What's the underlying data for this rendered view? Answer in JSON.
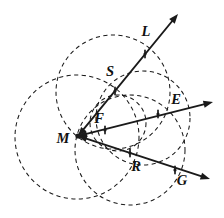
{
  "figure": {
    "kind": "geometry-diagram",
    "width": 224,
    "height": 218,
    "background_color": "#ffffff",
    "ink_color": "#1a1a1a",
    "label_color": "#111111",
    "vertex": {
      "name": "M",
      "label": "M",
      "x": 78,
      "y": 136,
      "label_x": 63,
      "label_y": 140
    },
    "labels": [
      {
        "name": "label-L",
        "text": "L",
        "x": 146,
        "y": 33
      },
      {
        "name": "label-S",
        "text": "S",
        "x": 110,
        "y": 73
      },
      {
        "name": "label-E",
        "text": "E",
        "x": 176,
        "y": 101
      },
      {
        "name": "label-F",
        "text": "F",
        "x": 99,
        "y": 120
      },
      {
        "name": "label-M",
        "text": "M",
        "x": 63,
        "y": 140
      },
      {
        "name": "label-R",
        "text": "R",
        "x": 136,
        "y": 168
      },
      {
        "name": "label-G",
        "text": "G",
        "x": 182,
        "y": 182
      }
    ],
    "rays": [
      {
        "name": "ray-ML",
        "label": "L",
        "from_x": 78,
        "from_y": 136,
        "to_x": 178,
        "to_y": 14,
        "double_headed": true
      },
      {
        "name": "ray-ME",
        "label": "E",
        "from_x": 78,
        "from_y": 136,
        "to_x": 213,
        "to_y": 102,
        "double_headed": true
      },
      {
        "name": "ray-MG",
        "label": "G",
        "from_x": 78,
        "from_y": 136,
        "to_x": 210,
        "to_y": 179,
        "double_headed": true
      }
    ],
    "marked_points": [
      {
        "name": "point-S",
        "label": "S",
        "x": 115,
        "y": 91
      },
      {
        "name": "point-L-cross",
        "label": "L",
        "x": 145,
        "y": 54
      },
      {
        "name": "point-F",
        "label": "F",
        "x": 105,
        "y": 130
      },
      {
        "name": "point-E",
        "label": "E",
        "x": 158,
        "y": 114
      },
      {
        "name": "point-R",
        "label": "R",
        "x": 130,
        "y": 153
      },
      {
        "name": "point-G",
        "label": "G",
        "x": 175,
        "y": 170
      }
    ],
    "circles": [
      {
        "name": "circle-left",
        "cx": 77,
        "cy": 137,
        "r": 62
      },
      {
        "name": "circle-top",
        "cx": 113,
        "cy": 92,
        "r": 57
      },
      {
        "name": "circle-bottom",
        "cx": 130,
        "cy": 150,
        "r": 55
      },
      {
        "name": "circle-right",
        "cx": 143,
        "cy": 118,
        "r": 47
      },
      {
        "name": "circle-inner",
        "cx": 118,
        "cy": 123,
        "r": 28
      }
    ]
  }
}
